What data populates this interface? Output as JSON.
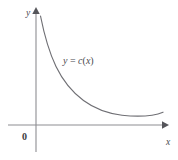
{
  "figure": {
    "name": "cost-function-graph",
    "background_color": "#ffffff",
    "width": 178,
    "height": 160
  },
  "axes": {
    "x_axis": {
      "label": "x",
      "label_x": 168,
      "label_y": 143,
      "line_color": "#8d8d92",
      "y_position": 125,
      "x_start": 8,
      "x_end": 162,
      "arrow_tip_x": 168
    },
    "y_axis": {
      "label": "y",
      "label_x": 28,
      "label_y": 13,
      "line_color": "#8d8d92",
      "x_position": 36,
      "y_start": 152,
      "y_end": 14,
      "arrow_tip_y": 8
    },
    "origin": {
      "label": "0",
      "label_x": 24,
      "label_y": 138
    }
  },
  "curve": {
    "label": "y = c(x)",
    "label_lhs": "y",
    "label_operator": " = ",
    "label_fn_name": "c",
    "label_open_paren": "(",
    "label_arg": "x",
    "label_close_paren": ")",
    "label_x": 63,
    "label_y": 63,
    "color": "#6f6f74",
    "stroke_width": 1.15,
    "path": "M 40.5 16 C 44.5 36, 49.5 53, 56 66.5 C 63 81, 72 92, 83.5 100.5 C 95 109, 108 113.5, 122 115.2 C 133 116.4, 144 116.3, 152 115.2 C 157 114.4, 160.5 113.3, 163 112.2"
  },
  "chart_data": {
    "type": "line",
    "title": "",
    "xlabel": "x",
    "ylabel": "y",
    "series": [
      {
        "name": "y = c(x)",
        "description": "decreasing convex average-cost curve that falls steeply then flattens to a shallow minimum and turns slightly upward",
        "x": [
          0.18,
          0.5,
          1.0,
          1.6,
          2.4,
          3.4,
          4.6,
          5.8,
          7.0,
          8.2,
          9.2,
          10.0
        ],
        "y": [
          9.4,
          7.6,
          5.9,
          4.6,
          3.2,
          2.1,
          1.35,
          0.95,
          0.78,
          0.76,
          0.82,
          0.9
        ]
      }
    ],
    "xlim": [
      0,
      10.6
    ],
    "ylim": [
      0,
      10.2
    ],
    "grid": false,
    "legend": false,
    "annotations": [
      {
        "text": "y = c(x)",
        "x": 2.2,
        "y": 6.2
      }
    ],
    "axis_ticks": {
      "x": [],
      "y": []
    },
    "origin_label": "0"
  }
}
